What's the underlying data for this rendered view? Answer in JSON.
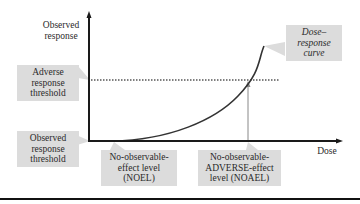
{
  "diagram": {
    "type": "dose-response",
    "axes": {
      "y_label": "Observed response",
      "x_label": "Dose"
    },
    "callouts": {
      "adverse_threshold": "Adverse response threshold",
      "observed_threshold": "Observed response threshold",
      "curve": "Dose–response curve",
      "noel": "No-observable-effect level (NOEL)",
      "noael": "No-observable-ADVERSE-effect level (NOAEL)"
    },
    "lines": {
      "adverse_threshold_line": "dotted",
      "noael_marker": "arrow"
    },
    "colors": {
      "callout_fill": "#dcdcdc",
      "axis": "#1a1a1a",
      "curve": "#333333",
      "marker": "#888888"
    }
  },
  "labels": {
    "y_axis_1": "Observed",
    "y_axis_2": "response",
    "x_axis": "Dose",
    "adverse_1": "Adverse",
    "adverse_2": "response",
    "adverse_3": "threshold",
    "observed_1": "Observed",
    "observed_2": "response",
    "observed_3": "threshold",
    "curve_1": "Dose–",
    "curve_2": "response",
    "curve_3": "curve",
    "noel_1": "No-observable-",
    "noel_2": "effect level",
    "noel_3": "(NOEL)",
    "noael_1": "No-observable-",
    "noael_2": "ADVERSE-effect",
    "noael_3": "level (NOAEL)"
  }
}
